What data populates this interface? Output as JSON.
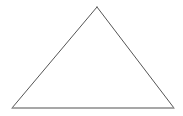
{
  "canvas": {
    "width": 183,
    "height": 116,
    "background_color": "#ffffff"
  },
  "figure": {
    "name": "triangle",
    "shape_type": "isosceles-triangle",
    "fill_color": "none",
    "stroke_color": "#555555",
    "base_stroke_color": "#8a8a8a",
    "stroke_width": 1,
    "base_stroke_width": 1.4,
    "vertices": [
      {
        "label": "apex",
        "x": 97,
        "y": 7
      },
      {
        "label": "bottom-right",
        "x": 174,
        "y": 108
      },
      {
        "label": "bottom-left",
        "x": 12,
        "y": 108
      }
    ],
    "points_attr": "97,7 174,108 12,108",
    "edges": [
      {
        "name": "left-edge",
        "from": "bottom-left",
        "to": "apex",
        "x1": 12,
        "y1": 108,
        "x2": 97,
        "y2": 7
      },
      {
        "name": "right-edge",
        "from": "apex",
        "to": "bottom-right",
        "x1": 97,
        "y1": 7,
        "x2": 174,
        "y2": 108
      },
      {
        "name": "base-edge",
        "from": "bottom-left",
        "to": "bottom-right",
        "x1": 12,
        "y1": 108,
        "x2": 174,
        "y2": 108
      }
    ]
  },
  "labels": {
    "title": "",
    "annotations": []
  }
}
